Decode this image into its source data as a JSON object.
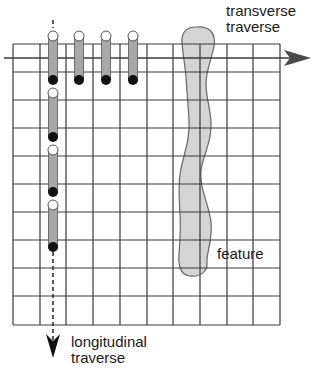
{
  "labels": {
    "transverse": [
      "transverse",
      "traverse"
    ],
    "feature": "feature",
    "longitudinal": [
      "longitudinal",
      "traverse"
    ]
  },
  "grid": {
    "x_lines": [
      13,
      40,
      66,
      93,
      120,
      147,
      173,
      200,
      227,
      253,
      280
    ],
    "y_lines": [
      44,
      72,
      100,
      128,
      156,
      184,
      212,
      240,
      268,
      296,
      325
    ],
    "line_color": "#3a3a3a"
  },
  "transverse_probes": [
    {
      "x": 53,
      "top": 36,
      "bottom": 80
    },
    {
      "x": 79,
      "top": 36,
      "bottom": 80
    },
    {
      "x": 106,
      "top": 36,
      "bottom": 80
    },
    {
      "x": 133,
      "top": 36,
      "bottom": 80
    }
  ],
  "longitudinal_probes": [
    {
      "x": 53,
      "top": 93,
      "bottom": 137
    },
    {
      "x": 53,
      "top": 150,
      "bottom": 192
    },
    {
      "x": 53,
      "top": 205,
      "bottom": 247
    }
  ],
  "colors": {
    "probe_body": "#a8a8a8",
    "probe_outline": "#555555",
    "probe_end_dark": "#111111",
    "probe_end_light": "#ffffff",
    "feature_fill": "#d4d4d4",
    "feature_stroke": "#666666",
    "arrow": "#4a4a4a"
  }
}
